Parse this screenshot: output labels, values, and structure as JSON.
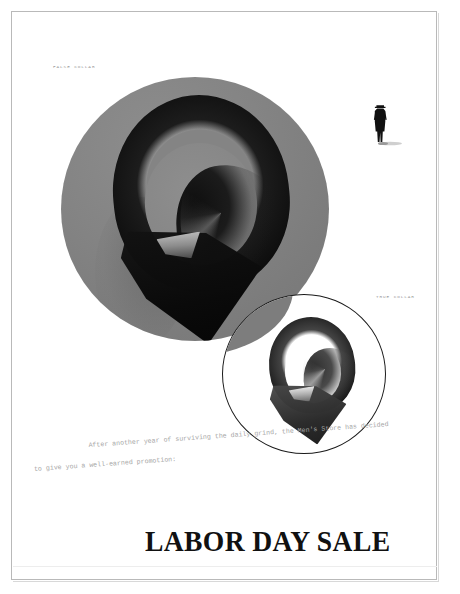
{
  "page": {
    "background_color": "#ffffff",
    "frame_color": "#b9b9b9"
  },
  "hero": {
    "disc_color": "#808080",
    "subject": "mens-dress-shirt-collar-top-view"
  },
  "inset": {
    "outline_color": "#1a1a1a",
    "background_color": "#ffffff",
    "subject": "mens-dress-shirt-collar-top-view-detail"
  },
  "labels": {
    "false_collar": "FALSE COLLAR",
    "true_collar": "TRUE COLLAR"
  },
  "body_copy": {
    "line_1": "After another year of surviving the daily grind, the Men's Store has decided",
    "line_2": "to give you a well-earned promotion:"
  },
  "headline": {
    "text": "LABOR DAY SALE",
    "color": "#111111"
  },
  "figure": {
    "name": "walking-man-silhouette",
    "color": "#111111"
  }
}
